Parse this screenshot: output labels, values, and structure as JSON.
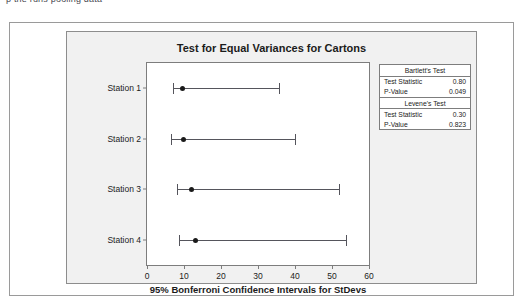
{
  "page": {
    "top_text": "p         the  runs  pooling  data"
  },
  "chart_data": {
    "type": "scatter",
    "title": "Test for Equal Variances for Cartons",
    "xlabel": "95% Bonferroni Confidence Intervals for StDevs",
    "ylabel": "",
    "xlim": [
      0,
      60
    ],
    "xticks": [
      0,
      10,
      20,
      30,
      40,
      50,
      60
    ],
    "grid": false,
    "categories": [
      "Station 1",
      "Station 2",
      "Station 3",
      "Station 4"
    ],
    "intervals": [
      {
        "category": "Station 1",
        "lower": 7.0,
        "point": 9.5,
        "upper": 35.8
      },
      {
        "category": "Station 2",
        "lower": 6.6,
        "point": 10.0,
        "upper": 40.0
      },
      {
        "category": "Station 3",
        "lower": 8.1,
        "point": 12.0,
        "upper": 52.0
      },
      {
        "category": "Station 4",
        "lower": 8.6,
        "point": 13.0,
        "upper": 53.8
      }
    ],
    "annotations": {
      "bartlett": {
        "heading": "Bartlett's Test",
        "test_statistic_label": "Test Statistic",
        "test_statistic": "0.80",
        "p_value_label": "P-Value",
        "p_value": "0.049"
      },
      "levene": {
        "heading": "Levene's Test",
        "test_statistic_label": "Test Statistic",
        "test_statistic": "0.30",
        "p_value_label": "P-Value",
        "p_value": "0.823"
      }
    }
  },
  "colors": {
    "panel_background": "#f1f1f1",
    "plot_background": "#ffffff",
    "line": "#55555c",
    "point": "#1a1a1a",
    "axis": "#7d7d7d"
  }
}
